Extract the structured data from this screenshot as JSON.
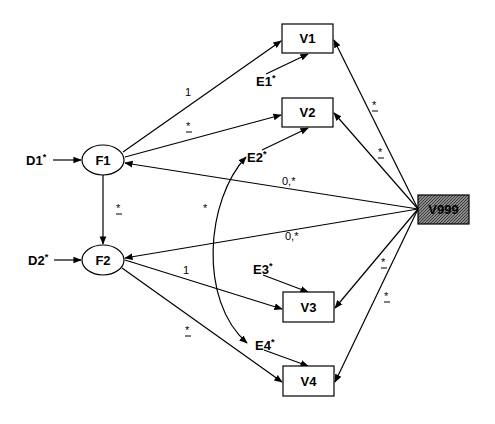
{
  "diagram": {
    "type": "structural-equation-model",
    "colors": {
      "line": "#000000",
      "background": "#ffffff",
      "constant_fill": "#6e6e6e"
    },
    "observed": [
      {
        "id": "V1",
        "label": "V1"
      },
      {
        "id": "V2",
        "label": "V2"
      },
      {
        "id": "V3",
        "label": "V3"
      },
      {
        "id": "V4",
        "label": "V4"
      }
    ],
    "constant": {
      "id": "V999",
      "label": "V999"
    },
    "factors": [
      {
        "id": "F1",
        "label": "F1"
      },
      {
        "id": "F2",
        "label": "F2"
      }
    ],
    "disturbances": [
      {
        "id": "D1",
        "label": "D1",
        "star": "*"
      },
      {
        "id": "D2",
        "label": "D2",
        "star": "*"
      }
    ],
    "errors": [
      {
        "id": "E1",
        "label": "E1",
        "star": "*"
      },
      {
        "id": "E2",
        "label": "E2",
        "star": "*"
      },
      {
        "id": "E3",
        "label": "E3",
        "star": "*"
      },
      {
        "id": "E4",
        "label": "E4",
        "star": "*"
      }
    ],
    "edge_labels": {
      "F1_V1": "1",
      "F1_V2": "*",
      "F1_F2": "*",
      "F2_V3": "1",
      "F2_V4": "*",
      "V999_F1": "0,*",
      "V999_F2": "0,*",
      "V999_V1": "*",
      "V999_V2": "*",
      "V999_V3": "*",
      "V999_V4": "*",
      "E2_E4": "*"
    }
  }
}
